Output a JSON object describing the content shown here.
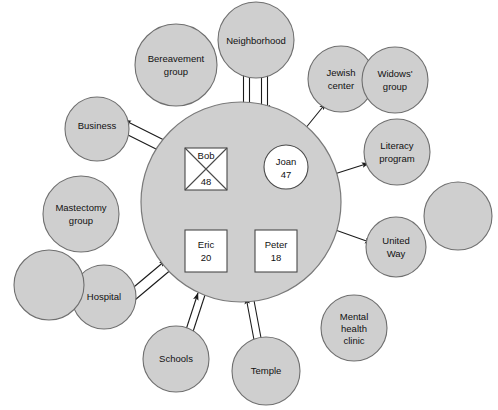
{
  "diagram": {
    "background_color": "#ffffff",
    "node_fill": "#cfcfcf",
    "node_stroke": "#6f6f6f",
    "line_color": "#1a1a1a"
  },
  "family": {
    "name": "family-system-circle",
    "members": [
      {
        "id": "bob",
        "label_line1": "Bob",
        "label_line2": "48",
        "shape": "square",
        "deceased": true
      },
      {
        "id": "joan",
        "label_line1": "Joan",
        "label_line2": "47",
        "shape": "circle",
        "deceased": false
      },
      {
        "id": "eric",
        "label_line1": "Eric",
        "label_line2": "20",
        "shape": "square",
        "deceased": false
      },
      {
        "id": "peter",
        "label_line1": "Peter",
        "label_line2": "18",
        "shape": "square",
        "deceased": false
      }
    ]
  },
  "external_systems": [
    {
      "id": "bereavement",
      "line1": "Bereavement",
      "line2": "group",
      "line3": ""
    },
    {
      "id": "neighborhood",
      "line1": "Neighborhood",
      "line2": "",
      "line3": ""
    },
    {
      "id": "jewish-center",
      "line1": "Jewish",
      "line2": "center",
      "line3": ""
    },
    {
      "id": "widows-group",
      "line1": "Widows'",
      "line2": "group",
      "line3": ""
    },
    {
      "id": "literacy",
      "line1": "Literacy",
      "line2": "program",
      "line3": ""
    },
    {
      "id": "business",
      "line1": "Business",
      "line2": "",
      "line3": ""
    },
    {
      "id": "mastectomy",
      "line1": "Mastectomy",
      "line2": "group",
      "line3": ""
    },
    {
      "id": "united-way",
      "line1": "United",
      "line2": "Way",
      "line3": ""
    },
    {
      "id": "hospital",
      "line1": "Hospital",
      "line2": "",
      "line3": ""
    },
    {
      "id": "schools",
      "line1": "Schools",
      "line2": "",
      "line3": ""
    },
    {
      "id": "temple",
      "line1": "Temple",
      "line2": "",
      "line3": ""
    },
    {
      "id": "mental-health",
      "line1": "Mental",
      "line2": "health",
      "line3": "clinic"
    },
    {
      "id": "blank-left",
      "line1": "",
      "line2": "",
      "line3": ""
    },
    {
      "id": "blank-right",
      "line1": "",
      "line2": "",
      "line3": ""
    }
  ],
  "connections": [
    {
      "from": "family",
      "to": "neighborhood",
      "style": "double-line",
      "direction": "bidirectional"
    },
    {
      "from": "family",
      "to": "business",
      "style": "double-line",
      "direction": "bidirectional"
    },
    {
      "from": "family",
      "to": "hospital",
      "style": "double-line",
      "direction": "bidirectional"
    },
    {
      "from": "family",
      "to": "schools",
      "style": "double-line",
      "direction": "bidirectional"
    },
    {
      "from": "family",
      "to": "temple",
      "style": "double-line",
      "direction": "bidirectional"
    },
    {
      "from": "family",
      "to": "jewish-center",
      "style": "single-line",
      "direction": "outward"
    },
    {
      "from": "family",
      "to": "literacy",
      "style": "single-line",
      "direction": "outward"
    },
    {
      "from": "family",
      "to": "united-way",
      "style": "single-line",
      "direction": "outward"
    }
  ]
}
